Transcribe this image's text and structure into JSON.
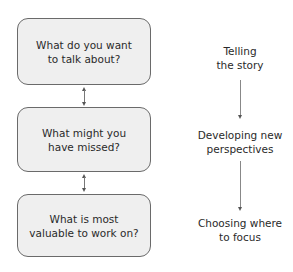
{
  "left_column": {
    "boxes": [
      {
        "text": "What do you want\nto talk about?"
      },
      {
        "text": "What might you\nhave missed?"
      },
      {
        "text": "What is most\nvaluable to work on?"
      }
    ],
    "connectors": [
      "bidirectional",
      "bidirectional"
    ]
  },
  "right_column": {
    "stages": [
      {
        "text": "Telling\nthe story"
      },
      {
        "text": "Developing new\nperspectives"
      },
      {
        "text": "Choosing where\nto focus"
      }
    ],
    "arrows": [
      "down",
      "down"
    ]
  },
  "colors": {
    "box_fill": "#efefef",
    "box_border": "#6a6a6a",
    "text": "#2a2a2a",
    "arrow": "#777777"
  }
}
